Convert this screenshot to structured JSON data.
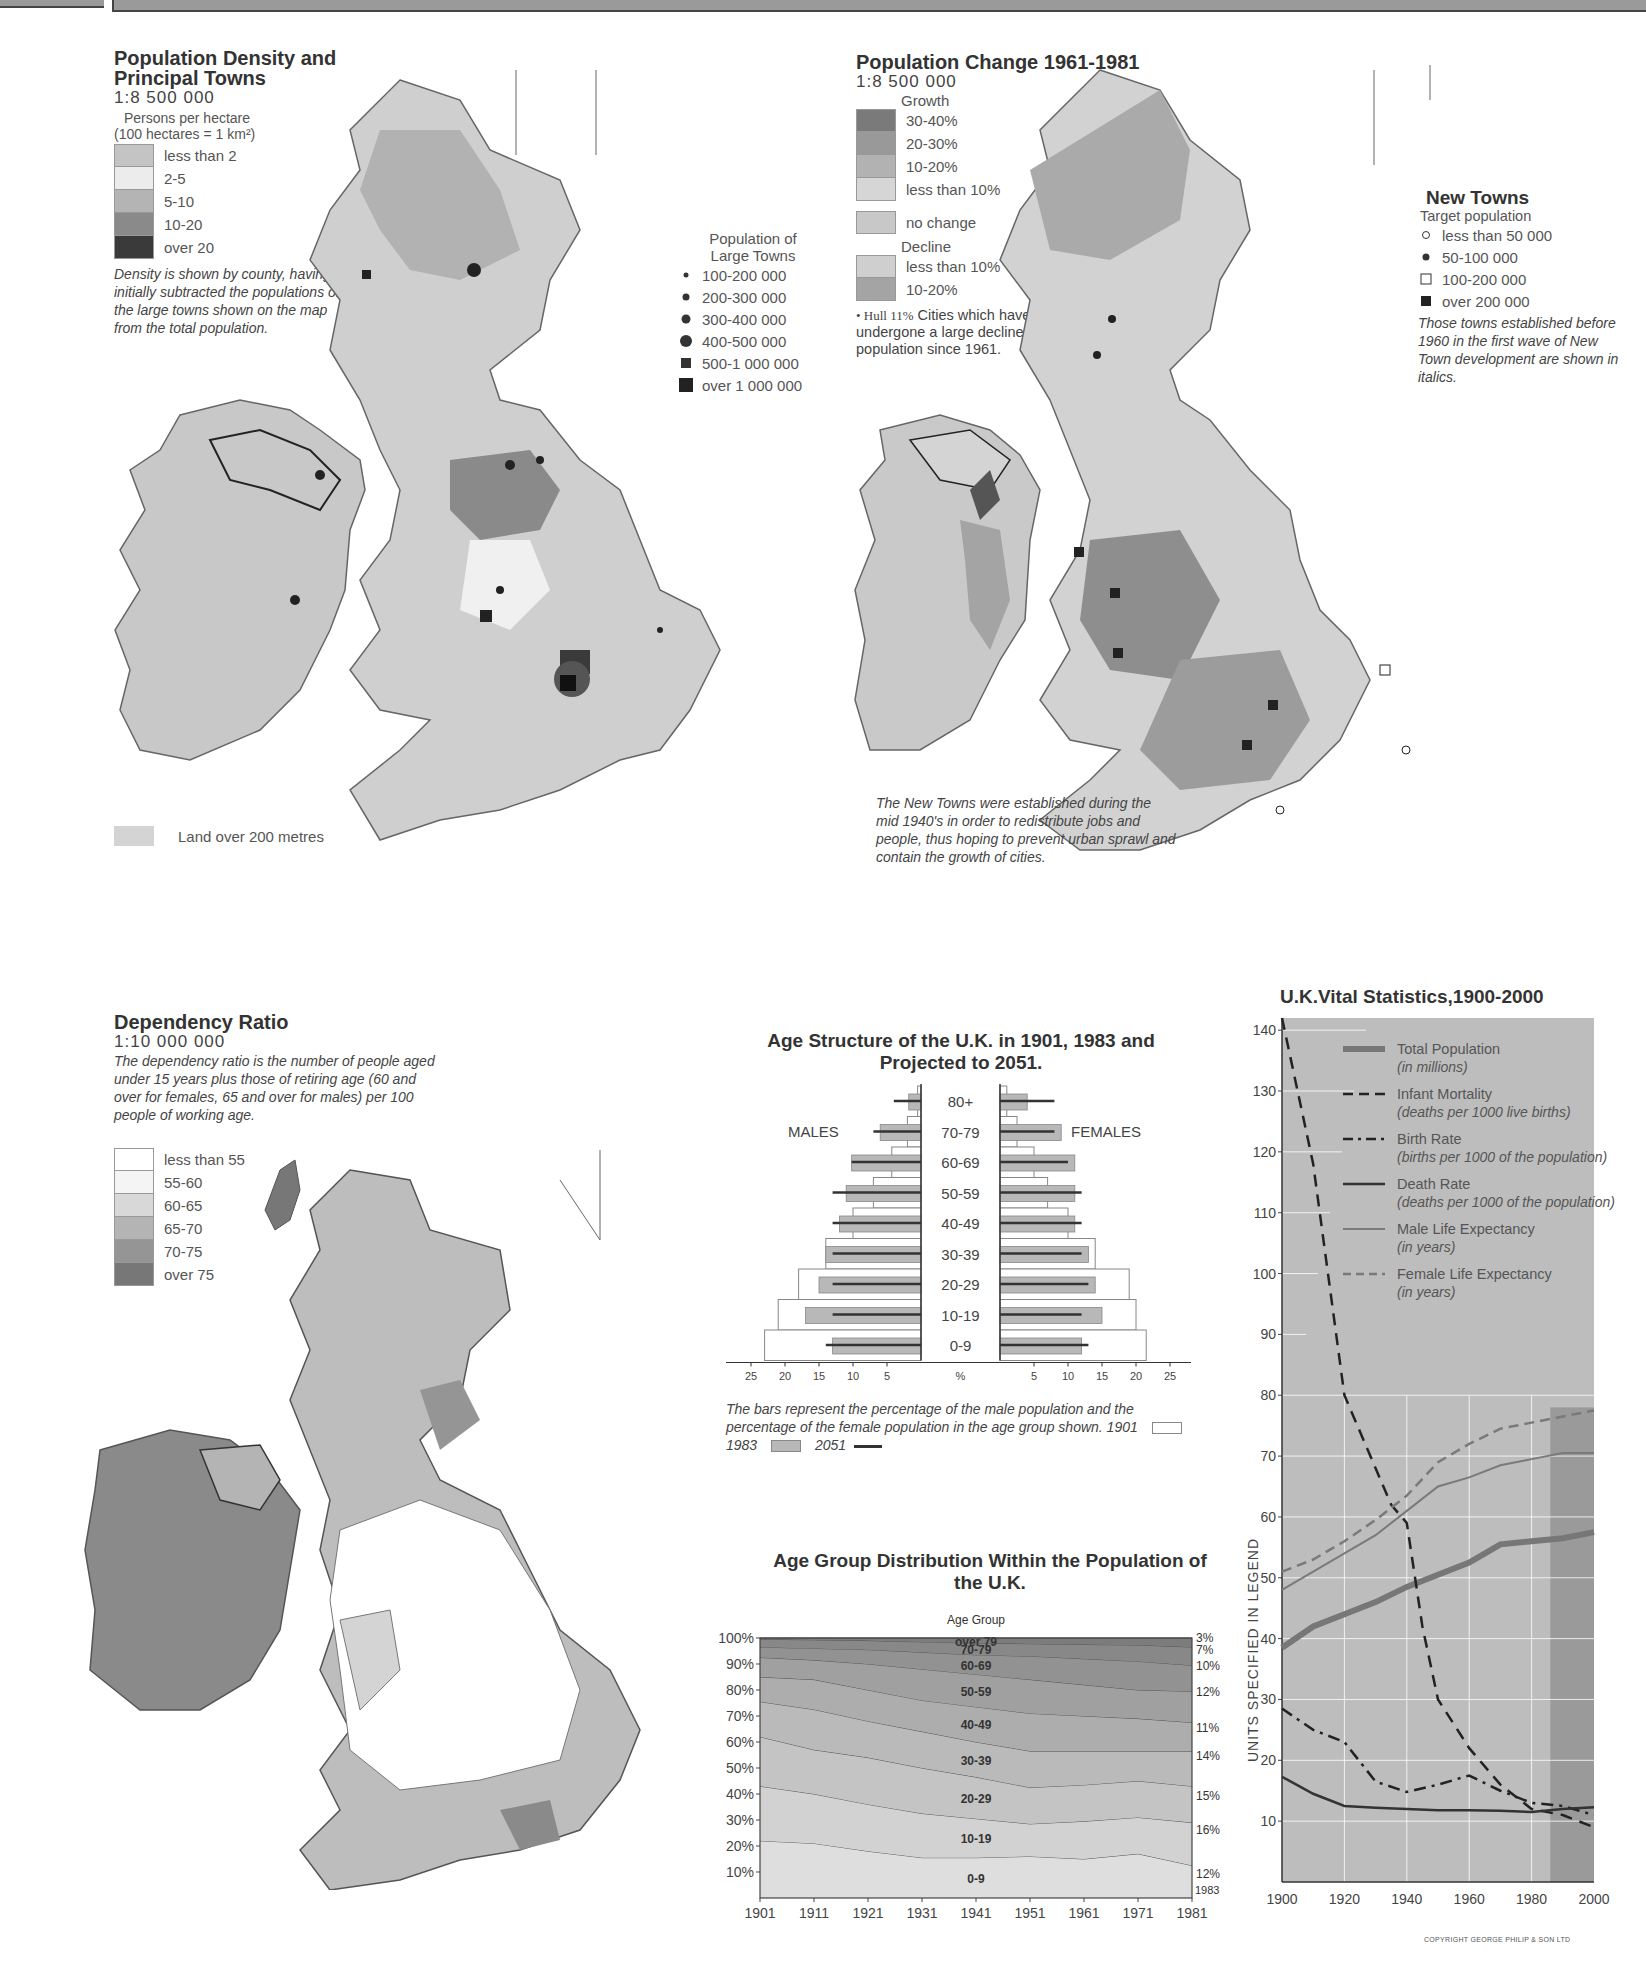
{
  "density_map": {
    "title_line1": "Population Density and",
    "title_line2": "Principal Towns",
    "scale": "1:8 500 000",
    "unit_line1": "Persons per hectare",
    "unit_line2": "(100 hectares = 1 km²)",
    "legend": [
      {
        "label": "less than 2",
        "color": "#c4c4c4"
      },
      {
        "label": "2-5",
        "color": "#ececec"
      },
      {
        "label": "5-10",
        "color": "#b4b4b4"
      },
      {
        "label": "10-20",
        "color": "#8a8a8a"
      },
      {
        "label": "over 20",
        "color": "#3a3a3a"
      }
    ],
    "note": "Density is shown by county, having initially subtracted the populations of the large towns shown on the map from the total population.",
    "towns_legend_title_1": "Population of",
    "towns_legend_title_2": "Large Towns",
    "towns_legend": [
      {
        "label": "100-200 000",
        "symbol": "dot-small"
      },
      {
        "label": "200-300 000",
        "symbol": "dot-medium"
      },
      {
        "label": "300-400 000",
        "symbol": "dot-large"
      },
      {
        "label": "400-500 000",
        "symbol": "dot-xlarge"
      },
      {
        "label": "500-1 000 000",
        "symbol": "square-medium"
      },
      {
        "label": "over 1 000 000",
        "symbol": "square-large"
      }
    ],
    "land_legend": "Land over 200 metres",
    "towns": [
      "Aberdeen",
      "Dundee",
      "Edinburgh",
      "Glasgow",
      "Belfast",
      "Dublin",
      "Cork",
      "Newcastle",
      "Sunderland",
      "Stockton",
      "Middlesbrough",
      "Blackpool",
      "Bradford",
      "Leeds",
      "Hull",
      "Preston",
      "Bolton",
      "Huddersfield",
      "Manchester",
      "Liverpool",
      "Warrington",
      "Stockport",
      "Sheffield",
      "Derby",
      "Nottingham",
      "Stoke-on-Trent",
      "Leicester",
      "Norwich",
      "Wolverhampton",
      "Birmingham",
      "Coventry",
      "Peterborough",
      "Northampton",
      "Cambridge",
      "Milton Keynes",
      "Ipswich",
      "Swansea",
      "Newport",
      "Oxford",
      "Luton",
      "Basildon",
      "Cardiff",
      "Bristol",
      "Reading",
      "Greater London",
      "Southend",
      "Southampton",
      "Havant",
      "Brighton",
      "Bournemouth",
      "Poole",
      "Portsmouth",
      "Plymouth"
    ]
  },
  "change_map": {
    "title": "Population Change 1961-1981",
    "scale": "1:8 500 000",
    "growth_label": "Growth",
    "growth_legend": [
      {
        "label": "30-40%",
        "color": "#7a7a7a"
      },
      {
        "label": "20-30%",
        "color": "#999999"
      },
      {
        "label": "10-20%",
        "color": "#b2b2b2"
      },
      {
        "label": "less than 10%",
        "color": "#d6d6d6"
      }
    ],
    "no_change_label": "no change",
    "no_change_color": "#c8c8c8",
    "decline_label": "Decline",
    "decline_legend": [
      {
        "label": "less than 10%",
        "color": "#cfcfcf"
      },
      {
        "label": "10-20%",
        "color": "#a4a4a4"
      }
    ],
    "cities_note_sample": "• Hull 11%",
    "cities_note": "Cities which have undergone a large decline in population since 1961.",
    "new_towns_title": "New Towns",
    "new_towns_subtitle": "Target population",
    "new_towns_legend": [
      {
        "label": "less than 50 000",
        "symbol": "circle-open"
      },
      {
        "label": "50-100 000",
        "symbol": "circle-filled"
      },
      {
        "label": "100-200 000",
        "symbol": "square-open"
      },
      {
        "label": "over 200 000",
        "symbol": "square-filled"
      }
    ],
    "new_towns_note": "Those towns established before 1960 in the first wave of New Town development are shown in italics.",
    "bottom_note": "The New Towns were established during the mid 1940's in order to redistribute jobs and people, thus hoping to prevent urban sprawl and contain the growth of cities.",
    "labels": [
      "Glenrothes",
      "Cumbernauld",
      "Edinburgh 10%",
      "Glasgow 33%",
      "Livingston",
      "Irvine",
      "East Kilbride",
      "Newcastle 17%",
      "Washington",
      "Peterlee",
      "Aycliffe",
      "Central Lancashire",
      "Skelmersdale",
      "Liverpool 32%",
      "Runcorn",
      "Warrington",
      "Manchester 32%",
      "Sheffield 8%",
      "Hull 11%",
      "Nottingham 13%",
      "Stoke-on-Trent 9%",
      "Telford",
      "Newtown",
      "Birmingham 15%",
      "Peterborough",
      "Corby",
      "Northampton",
      "Redditch",
      "Milton Keynes",
      "Stevenage",
      "Welwyn Garden City",
      "Cwmbran",
      "Hemel Hempstead",
      "Harlow",
      "Hatfield",
      "Basildon",
      "Cardiff 6%",
      "Bristol 11%",
      "London 16%",
      "Bracknell",
      "Crawley",
      "Portsmouth 16%"
    ]
  },
  "dependency_map": {
    "title": "Dependency Ratio",
    "scale": "1:10 000 000",
    "note": "The dependency ratio is the number of people aged under 15 years plus those of retiring age (60 and over for females, 65 and over for males) per 100 people of working age.",
    "legend": [
      {
        "label": "less than 55",
        "color": "#ffffff"
      },
      {
        "label": "55-60",
        "color": "#f4f4f4"
      },
      {
        "label": "60-65",
        "color": "#d8d8d8"
      },
      {
        "label": "65-70",
        "color": "#b4b4b4"
      },
      {
        "label": "70-75",
        "color": "#959595"
      },
      {
        "label": "over 75",
        "color": "#777777"
      }
    ]
  },
  "chart_data": [
    {
      "type": "bar",
      "title": "Age Structure of the U.K. in 1901, 1983 and Projected to 2051.",
      "orientation": "horizontal-population-pyramid",
      "categories": [
        "80+",
        "70-79",
        "60-69",
        "50-59",
        "40-49",
        "30-39",
        "20-29",
        "10-19",
        "0-9"
      ],
      "xlabel": "%",
      "x_ticks": [
        25,
        20,
        15,
        10,
        5,
        5,
        10,
        15,
        20,
        25
      ],
      "xlim": [
        0,
        25
      ],
      "left_label": "MALES",
      "right_label": "FEMALES",
      "series": [
        {
          "name": "1901",
          "style": "white-bar",
          "males": [
            0.5,
            2,
            4.3,
            7,
            10,
            14,
            18,
            21,
            23
          ],
          "females": [
            1,
            2.5,
            5,
            7,
            10,
            14,
            19,
            20,
            21.5
          ]
        },
        {
          "name": "1983",
          "style": "grey-bar",
          "males": [
            1.8,
            6,
            10.2,
            11,
            12,
            14,
            15,
            17,
            13
          ],
          "females": [
            4,
            9,
            11,
            11,
            11,
            13,
            14,
            15,
            12
          ]
        },
        {
          "name": "2051",
          "style": "line",
          "males": [
            4,
            7,
            10.2,
            13,
            13,
            13,
            13,
            13,
            14
          ],
          "females": [
            8,
            8,
            10,
            12,
            12,
            12,
            13,
            12,
            13
          ]
        }
      ],
      "note": "The bars represent the percentage of the male population and the percentage of the female population in the age group shown.",
      "legend": [
        {
          "label": "1901"
        },
        {
          "label": "1983"
        },
        {
          "label": "2051"
        }
      ]
    },
    {
      "type": "area",
      "title": "Age Group Distribution Within the Population of the U.K.",
      "legend_title": "Age Group",
      "x": [
        1901,
        1911,
        1921,
        1931,
        1941,
        1951,
        1961,
        1971,
        1981
      ],
      "y_ticks": [
        "10%",
        "20%",
        "30%",
        "40%",
        "50%",
        "60%",
        "70%",
        "80%",
        "90%",
        "100%"
      ],
      "ylim": [
        0,
        100
      ],
      "stacked": true,
      "series_cumulative_top": [
        {
          "name": "0-9",
          "values": [
            22,
            21,
            18,
            15.5,
            15.5,
            16,
            15,
            17,
            12.5
          ]
        },
        {
          "name": "10-19",
          "values": [
            43,
            40,
            36,
            32.5,
            30.5,
            28.5,
            29.5,
            31,
            29
          ]
        },
        {
          "name": "20-29",
          "values": [
            62,
            57,
            54,
            50,
            46.5,
            42.5,
            43.5,
            45,
            43
          ]
        },
        {
          "name": "30-39",
          "values": [
            75.5,
            72.5,
            68,
            64,
            60,
            56.5,
            56.5,
            56.5,
            56.5
          ]
        },
        {
          "name": "40-49",
          "values": [
            85,
            84,
            80,
            76,
            73.5,
            71,
            70,
            69,
            67.5
          ]
        },
        {
          "name": "50-59",
          "values": [
            92.5,
            91.5,
            90,
            88,
            86,
            84,
            82,
            80,
            79.5
          ]
        },
        {
          "name": "60-69",
          "values": [
            96.5,
            96,
            95.5,
            94.5,
            93.5,
            93,
            92,
            91,
            89.5
          ]
        },
        {
          "name": "70-79",
          "values": [
            99.5,
            99.3,
            99,
            98.5,
            98,
            97.8,
            97.5,
            97.3,
            96.5
          ]
        },
        {
          "name": "over 79",
          "values": [
            100,
            100,
            100,
            100,
            100,
            100,
            100,
            100,
            100
          ]
        }
      ],
      "right_labels_1983": [
        {
          "name": "over 79",
          "value": "3%"
        },
        {
          "name": "70-79",
          "value": "7%"
        },
        {
          "name": "60-69",
          "value": "10%"
        },
        {
          "name": "50-59",
          "value": "12%"
        },
        {
          "name": "40-49",
          "value": "11%"
        },
        {
          "name": "30-39",
          "value": "14%"
        },
        {
          "name": "20-29",
          "value": "15%"
        },
        {
          "name": "10-19",
          "value": "16%"
        },
        {
          "name": "0-9",
          "value": "12%"
        }
      ],
      "right_year_label": "1983"
    },
    {
      "type": "line",
      "title": "U.K.Vital Statistics,1900-2000",
      "ylabel": "UNITS SPECIFIED IN LEGEND",
      "xlabel": "",
      "x_ticks": [
        1900,
        1920,
        1940,
        1960,
        1980,
        2000
      ],
      "y_ticks": [
        10,
        20,
        30,
        40,
        50,
        60,
        70,
        80,
        90,
        100,
        110,
        120,
        130,
        140
      ],
      "xlim": [
        1900,
        2000
      ],
      "ylim": [
        0,
        142
      ],
      "projection_shaded_from": 1986,
      "grid": true,
      "series": [
        {
          "name": "Total Population",
          "unit": "(in millions)",
          "style": "thick-grey",
          "x": [
            1900,
            1910,
            1920,
            1930,
            1940,
            1950,
            1960,
            1970,
            1980,
            1990,
            2000
          ],
          "values": [
            38.5,
            42,
            44,
            46,
            48.5,
            50.5,
            52.5,
            55.5,
            56,
            56.5,
            57.5
          ]
        },
        {
          "name": "Infant Mortality",
          "unit": "(deaths per 1000 live births)",
          "style": "dashed-black",
          "x": [
            1900,
            1910,
            1920,
            1930,
            1935,
            1940,
            1945,
            1950,
            1960,
            1970,
            1980,
            1990,
            2000
          ],
          "values": [
            142,
            118,
            80,
            68,
            62,
            59,
            42,
            30,
            22,
            16,
            12,
            11,
            9
          ]
        },
        {
          "name": "Birth Rate",
          "unit": "(births per 1000 of the population)",
          "style": "dash-dot-black",
          "x": [
            1900,
            1910,
            1920,
            1930,
            1940,
            1950,
            1960,
            1970,
            1980,
            1990,
            2000
          ],
          "values": [
            28.5,
            25,
            23,
            16.5,
            14.8,
            16,
            17.5,
            15,
            13,
            12.5,
            11
          ]
        },
        {
          "name": "Death Rate",
          "unit": "(deaths per 1000 of the population)",
          "style": "solid-black",
          "x": [
            1900,
            1910,
            1920,
            1930,
            1940,
            1950,
            1960,
            1970,
            1980,
            1990,
            2000
          ],
          "values": [
            17.3,
            14.5,
            12.5,
            12.2,
            12,
            11.8,
            11.8,
            11.7,
            11.5,
            12,
            12.3
          ]
        },
        {
          "name": "Male Life Expectancy",
          "unit": "(in years)",
          "style": "thin-grey",
          "x": [
            1900,
            1910,
            1920,
            1930,
            1940,
            1950,
            1960,
            1970,
            1980,
            1990,
            2000
          ],
          "values": [
            48,
            51,
            54,
            57,
            61,
            65,
            66.5,
            68.5,
            69.5,
            70.5,
            70.5
          ]
        },
        {
          "name": "Female Life Expectancy",
          "unit": "(in years)",
          "style": "dashed-grey",
          "x": [
            1900,
            1910,
            1920,
            1930,
            1940,
            1950,
            1960,
            1970,
            1980,
            1990,
            2000
          ],
          "values": [
            51,
            53,
            56,
            59.5,
            63.5,
            69,
            72,
            74.5,
            75.5,
            76.5,
            77.5
          ]
        }
      ]
    }
  ],
  "copyright": "COPYRIGHT GEORGE PHILIP & SON LTD"
}
